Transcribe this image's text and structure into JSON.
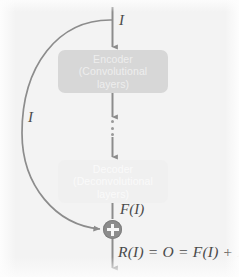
{
  "figure": {
    "kind": "residual-autoencoder-block-diagram",
    "background_color": "#f3f3f3",
    "stroke_color": "#8c8c8c",
    "text_color": "#4a4a4a"
  },
  "nodes": {
    "encoder": {
      "line1": "Encoder",
      "line2": "(Convolutional",
      "line3": "layers)",
      "fill_color": "#d7d7d7",
      "text_color": "#eeeeee"
    },
    "decoder": {
      "line1": "Decoder",
      "line2": "(Deconvolutional",
      "line3": "layers)",
      "fill_color": "#f0f0f0",
      "text_color": "#fafafa"
    },
    "sum": {
      "symbol": "+",
      "fill_color": "#8c8c8c",
      "symbol_color": "#f7f7f7"
    }
  },
  "labels": {
    "input": "I",
    "skip": "I",
    "residual": "F(I)",
    "output_equation": "R(I) = O = F(I) + I"
  },
  "icons": {
    "vertical_ellipsis": "⋮",
    "arrow_head": "▼"
  }
}
